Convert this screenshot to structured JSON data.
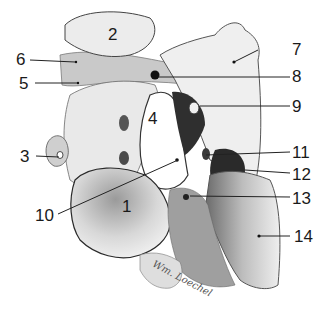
{
  "figure": {
    "type": "anatomical-illustration",
    "signature": "Wm. Loechel",
    "colors": {
      "bone_light": "#f4f4f4",
      "bone_mid": "#cfcfcf",
      "bone_dark": "#8a8a8a",
      "cavity_dark": "#2e2e2e",
      "line": "#222222"
    },
    "labels": [
      {
        "id": "1",
        "text": "1"
      },
      {
        "id": "2",
        "text": "2"
      },
      {
        "id": "3",
        "text": "3"
      },
      {
        "id": "4",
        "text": "4"
      },
      {
        "id": "5",
        "text": "5"
      },
      {
        "id": "6",
        "text": "6"
      },
      {
        "id": "7",
        "text": "7"
      },
      {
        "id": "8",
        "text": "8"
      },
      {
        "id": "9",
        "text": "9"
      },
      {
        "id": "10",
        "text": "10"
      },
      {
        "id": "11",
        "text": "11"
      },
      {
        "id": "12",
        "text": "12"
      },
      {
        "id": "13",
        "text": "13"
      },
      {
        "id": "14",
        "text": "14"
      }
    ]
  }
}
